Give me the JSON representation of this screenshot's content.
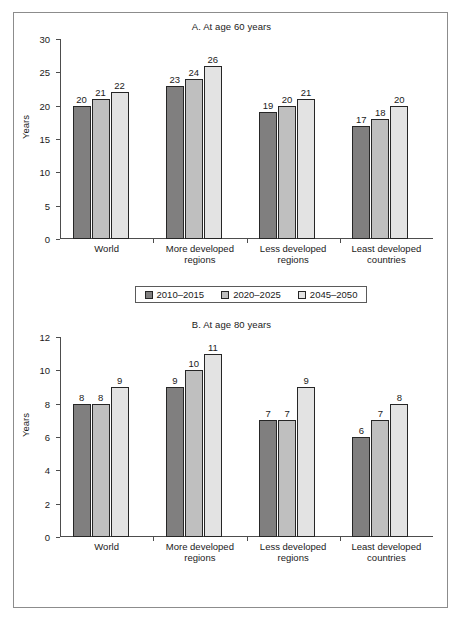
{
  "figure": {
    "series_colors": [
      "#807f7f",
      "#bfbfbf",
      "#e3e3e3"
    ],
    "legend_labels": [
      "2010–2015",
      "2020–2025",
      "2045–2050"
    ]
  },
  "chart_data": [
    {
      "type": "bar",
      "title": "A. At age 60 years",
      "xlabel": "",
      "ylabel": "Years",
      "ylim": [
        0,
        30
      ],
      "yticks": [
        0,
        5,
        10,
        15,
        20,
        25,
        30
      ],
      "grid": false,
      "legend_position": "bottom",
      "categories": [
        "World",
        "More developed regions",
        "Less developed regions",
        "Least developed countries"
      ],
      "categories_lines": [
        [
          "World"
        ],
        [
          "More developed",
          "regions"
        ],
        [
          "Less developed",
          "regions"
        ],
        [
          "Least developed",
          "countries"
        ]
      ],
      "series": [
        {
          "name": "2010–2015",
          "values": [
            20,
            23,
            19,
            17
          ]
        },
        {
          "name": "2020–2025",
          "values": [
            21,
            24,
            20,
            18
          ]
        },
        {
          "name": "2045–2050",
          "values": [
            22,
            26,
            21,
            20
          ]
        }
      ]
    },
    {
      "type": "bar",
      "title": "B. At age 80 years",
      "xlabel": "",
      "ylabel": "Years",
      "ylim": [
        0,
        12
      ],
      "yticks": [
        0,
        2,
        4,
        6,
        8,
        10,
        12
      ],
      "grid": false,
      "legend_position": "bottom",
      "categories": [
        "World",
        "More developed regions",
        "Less developed regions",
        "Least developed countries"
      ],
      "categories_lines": [
        [
          "World"
        ],
        [
          "More developed",
          "regions"
        ],
        [
          "Less developed",
          "regions"
        ],
        [
          "Least developed",
          "countries"
        ]
      ],
      "series": [
        {
          "name": "2010–2015",
          "values": [
            8,
            9,
            7,
            6
          ]
        },
        {
          "name": "2020–2025",
          "values": [
            8,
            10,
            7,
            7
          ]
        },
        {
          "name": "2045–2050",
          "values": [
            9,
            11,
            9,
            8
          ]
        }
      ]
    }
  ]
}
